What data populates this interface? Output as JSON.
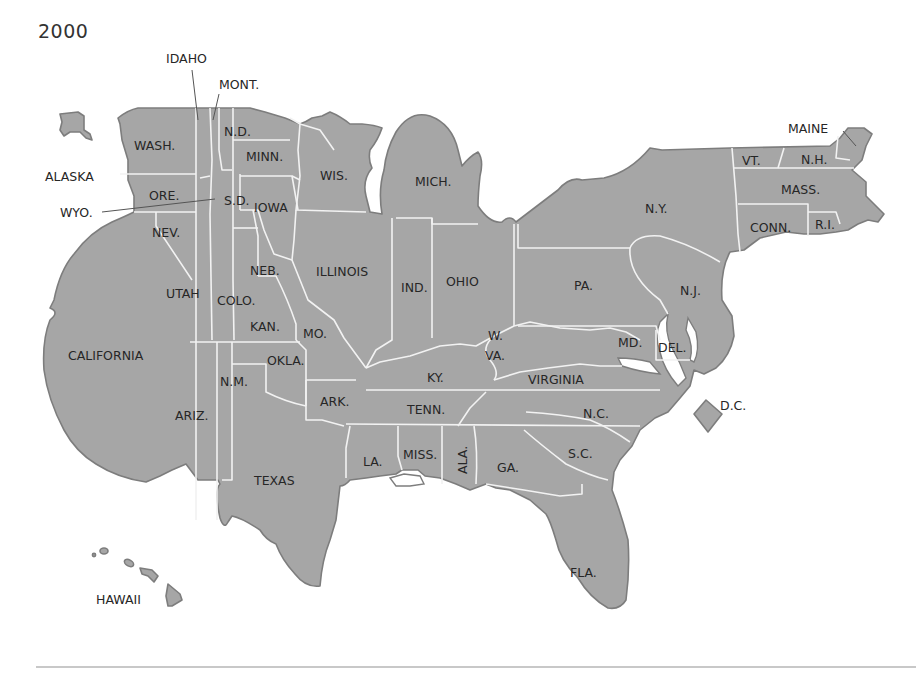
{
  "map": {
    "title": "2000",
    "fill_color": "#a6a6a6",
    "border_color": "#f2f2f2",
    "outline_color": "#7d7d7d",
    "label_color": "#262626",
    "labels": {
      "idaho": "IDAHO",
      "mont": "MONT.",
      "wash": "WASH.",
      "nd": "N.D.",
      "minn": "MINN.",
      "wis": "WIS.",
      "mich": "MICH.",
      "maine": "MAINE",
      "vt": "VT.",
      "nh": "N.H.",
      "mass": "MASS.",
      "alaska": "ALASKA",
      "ore": "ORE.",
      "wyo": "WYO.",
      "sd": "S.D.",
      "iowa": "IOWA",
      "ny": "N.Y.",
      "conn": "CONN.",
      "ri": "R.I.",
      "nev": "NEV.",
      "neb": "NEB.",
      "illinois": "ILLINOIS",
      "ind": "IND.",
      "ohio": "OHIO",
      "pa": "PA.",
      "nj": "N.J.",
      "utah": "UTAH",
      "colo": "COLO.",
      "kan": "KAN.",
      "mo": "MO.",
      "w": "W.",
      "va_wv": "VA.",
      "md": "MD.",
      "del": "DEL.",
      "california": "CALIFORNIA",
      "okla": "OKLA.",
      "ky": "KY.",
      "virginia": "VIRGINIA",
      "nm": "N.M.",
      "ark": "ARK.",
      "tenn": "TENN.",
      "dc": "D.C.",
      "nc": "N.C.",
      "ariz": "ARIZ.",
      "sc": "S.C.",
      "la": "LA.",
      "miss": "MISS.",
      "ala": "ALA.",
      "ga": "GA.",
      "texas": "TEXAS",
      "fla": "FLA.",
      "hawaii": "HAWAII"
    }
  }
}
